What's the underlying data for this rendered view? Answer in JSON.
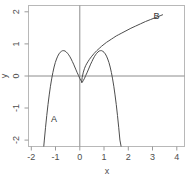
{
  "chart_data": {
    "type": "line",
    "title": "",
    "xlabel": "x",
    "ylabel": "y",
    "xlim": [
      -2.2,
      4.2
    ],
    "ylim": [
      -2.2,
      2.2
    ],
    "grid": false,
    "legend": "none",
    "xticks": [
      -2,
      -1,
      0,
      1,
      2,
      3,
      4
    ],
    "xticklabels": [
      "-2",
      "-1",
      "0",
      "1",
      "2",
      "3",
      "4"
    ],
    "yticks": [
      -2,
      -1,
      0,
      1,
      2
    ],
    "yticklabels": [
      "-2",
      "-1",
      "0",
      "1",
      "2"
    ],
    "axis_lines": {
      "x_axis_at_y": 0,
      "y_axis_at_x": 0,
      "color": "#808080"
    },
    "annotations": [
      {
        "text": "A",
        "x": -1.15,
        "y": -1.35
      },
      {
        "text": "B",
        "x": 3.05,
        "y": 1.88
      }
    ],
    "series": [
      {
        "name": "A",
        "label": "A",
        "color": "#4d4d4d",
        "comment": "W-shaped even polynomial, peaks approx 0.8 at x=+/-1, local min approx -0.2 at x=0, falls steeply past x=+/-1.3",
        "x": [
          -1.58,
          -1.55,
          -1.5,
          -1.45,
          -1.4,
          -1.35,
          -1.3,
          -1.25,
          -1.2,
          -1.15,
          -1.1,
          -1.05,
          -1.0,
          -0.95,
          -0.9,
          -0.85,
          -0.8,
          -0.75,
          -0.7,
          -0.65,
          -0.6,
          -0.55,
          -0.5,
          -0.45,
          -0.4,
          -0.35,
          -0.3,
          -0.25,
          -0.2,
          -0.15,
          -0.1,
          -0.05,
          0.0,
          0.05,
          0.1,
          0.15,
          0.2,
          0.25,
          0.3,
          0.35,
          0.4,
          0.45,
          0.5,
          0.55,
          0.6,
          0.65,
          0.7,
          0.75,
          0.8,
          0.85,
          0.9,
          0.95,
          1.0,
          1.05,
          1.1,
          1.15,
          1.2,
          1.25,
          1.3,
          1.35,
          1.4,
          1.45,
          1.5,
          1.55,
          1.6,
          1.62
        ],
        "y": [
          -2.25,
          -2.0,
          -1.6,
          -1.23,
          -0.89,
          -0.59,
          -0.32,
          -0.09,
          0.11,
          0.28,
          0.42,
          0.53,
          0.62,
          0.69,
          0.74,
          0.77,
          0.79,
          0.79,
          0.78,
          0.75,
          0.71,
          0.66,
          0.6,
          0.53,
          0.45,
          0.37,
          0.28,
          0.19,
          0.1,
          0.02,
          -0.07,
          -0.14,
          -0.2,
          -0.14,
          -0.07,
          0.02,
          0.1,
          0.19,
          0.28,
          0.37,
          0.45,
          0.53,
          0.6,
          0.66,
          0.71,
          0.75,
          0.78,
          0.79,
          0.79,
          0.77,
          0.74,
          0.69,
          0.62,
          0.53,
          0.42,
          0.28,
          0.11,
          -0.09,
          -0.32,
          -0.59,
          -0.89,
          -1.23,
          -1.6,
          -2.0,
          -2.2,
          -2.25
        ]
      },
      {
        "name": "B",
        "label": "B",
        "color": "#4d4d4d",
        "comment": "Square-root-like increasing curve from near origin, exits top of panel near x=3.3",
        "x": [
          -0.02,
          0.0,
          0.05,
          0.1,
          0.15,
          0.2,
          0.25,
          0.3,
          0.4,
          0.5,
          0.6,
          0.7,
          0.8,
          0.9,
          1.0,
          1.1,
          1.2,
          1.3,
          1.4,
          1.5,
          1.6,
          1.8,
          2.0,
          2.2,
          2.4,
          2.6,
          2.8,
          3.0,
          3.2,
          3.3
        ],
        "y": [
          -0.2,
          -0.05,
          0.12,
          0.24,
          0.33,
          0.4,
          0.46,
          0.52,
          0.62,
          0.71,
          0.79,
          0.86,
          0.93,
          0.99,
          1.05,
          1.1,
          1.15,
          1.2,
          1.25,
          1.29,
          1.33,
          1.41,
          1.49,
          1.56,
          1.63,
          1.7,
          1.76,
          1.82,
          1.88,
          1.91
        ]
      }
    ]
  },
  "axes": {
    "xlabel": "x",
    "ylabel": "y"
  },
  "labels": {
    "curve_a": "A",
    "curve_b": "B"
  },
  "colors": {
    "frame": "#b3b3b3",
    "axis": "#8c8c8c",
    "curve": "#4d4d4d",
    "text": "#4d4d4d",
    "background": "#ffffff"
  }
}
